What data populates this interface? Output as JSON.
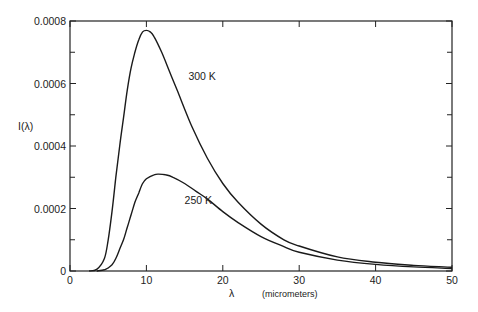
{
  "chart_data": {
    "type": "line",
    "title": "",
    "xlabel": "λ",
    "xlabel_unit": "(micrometers)",
    "ylabel": "I(λ)",
    "xlim": [
      0,
      50
    ],
    "ylim": [
      0,
      0.0008
    ],
    "x_ticks": [
      0,
      10,
      20,
      30,
      40,
      50
    ],
    "x_tick_labels": [
      "0",
      "10",
      "20",
      "30",
      "40",
      "50"
    ],
    "y_ticks": [
      0,
      0.0002,
      0.0004,
      0.0006,
      0.0008
    ],
    "y_tick_labels": [
      "0",
      "0.0002",
      "0.0004",
      "0.0006",
      "0.0008"
    ],
    "y_minor_ticks": [
      0.0001,
      0.0003,
      0.0005,
      0.0007
    ],
    "grid": false,
    "legend": "inline annotations",
    "series": [
      {
        "name": "300 K",
        "label": "300 K",
        "label_pos": [
          15.5,
          0.00061
        ],
        "x": [
          2.5,
          3.5,
          4.5,
          5,
          5.5,
          6,
          6.5,
          7,
          7.5,
          8,
          8.5,
          9,
          9.5,
          10,
          10.5,
          11,
          12,
          13,
          14,
          16,
          18,
          20,
          22,
          25,
          28,
          30,
          35,
          40,
          45,
          50
        ],
        "y": [
          0,
          5e-06,
          4e-05,
          0.0001,
          0.00019,
          0.0003,
          0.0004,
          0.00049,
          0.00058,
          0.00065,
          0.0007,
          0.00074,
          0.000765,
          0.00077,
          0.000765,
          0.00075,
          0.0007,
          0.00064,
          0.00058,
          0.00046,
          0.00036,
          0.00028,
          0.00022,
          0.00015,
          0.0001,
          8e-05,
          4.5e-05,
          2.8e-05,
          1.8e-05,
          1.2e-05
        ]
      },
      {
        "name": "250 K",
        "label": "250 K",
        "label_pos": [
          15,
          0.000215
        ],
        "x": [
          3.5,
          4.5,
          5,
          5.5,
          6,
          6.5,
          7,
          7.5,
          8,
          8.5,
          9,
          9.5,
          10,
          11,
          11.6,
          12.5,
          13.5,
          15,
          16.5,
          18,
          20,
          22,
          25,
          28,
          30,
          35,
          40,
          45,
          50
        ],
        "y": [
          0,
          4e-06,
          1e-05,
          2e-05,
          4e-05,
          7e-05,
          0.0001,
          0.00014,
          0.00018,
          0.00022,
          0.00025,
          0.00028,
          0.000295,
          0.000308,
          0.00031,
          0.000308,
          0.0003,
          0.00028,
          0.000255,
          0.00023,
          0.00019,
          0.000155,
          0.00011,
          7.8e-05,
          6e-05,
          3.5e-05,
          2.1e-05,
          1.3e-05,
          8e-06
        ]
      }
    ]
  }
}
